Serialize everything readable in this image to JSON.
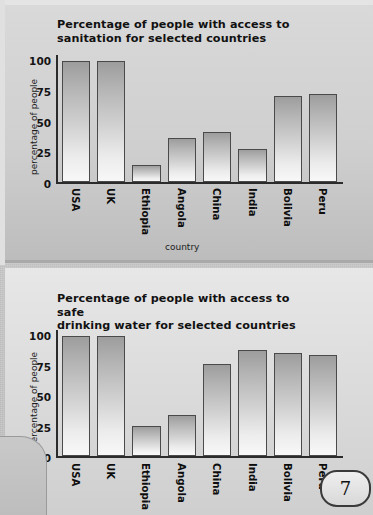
{
  "page": {
    "page_number": "7"
  },
  "chart_data": [
    {
      "type": "bar",
      "title": "Percentage of people with access to\nsanitation for selected countries",
      "xlabel": "country",
      "ylabel": "percentage of people",
      "categories": [
        "USA",
        "UK",
        "Ethiopia",
        "Angola",
        "China",
        "India",
        "Bolivia",
        "Peru"
      ],
      "values": [
        100,
        100,
        14,
        36,
        41,
        27,
        71,
        73
      ],
      "ylim": [
        0,
        105
      ],
      "yticks": [
        0,
        25,
        50,
        75,
        100
      ],
      "ytick_labels": [
        "0",
        "25",
        "50",
        "75",
        "100"
      ],
      "grid": false,
      "legend": "none"
    },
    {
      "type": "bar",
      "title": "Percentage of people with access to safe\ndrinking water for selected countries",
      "xlabel": "",
      "ylabel": "percentage of people",
      "categories": [
        "USA",
        "UK",
        "Ethiopia",
        "Angola",
        "China",
        "India",
        "Bolivia",
        "Peru"
      ],
      "values": [
        100,
        100,
        25,
        34,
        77,
        88,
        86,
        84
      ],
      "ylim": [
        0,
        105
      ],
      "yticks": [
        0,
        25,
        50,
        75,
        100
      ],
      "ytick_labels": [
        "0",
        "25",
        "50",
        "75",
        "100"
      ],
      "grid": false,
      "legend": "none"
    }
  ]
}
